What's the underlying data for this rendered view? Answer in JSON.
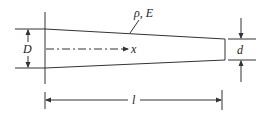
{
  "diagram": {
    "labels": {
      "material": "ρ, E",
      "axis": "x",
      "large_diameter": "D",
      "small_diameter": "d",
      "length": "l"
    },
    "colors": {
      "line": "#333333",
      "background": "#ffffff"
    }
  }
}
